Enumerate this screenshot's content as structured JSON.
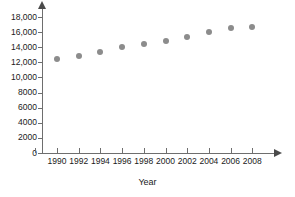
{
  "chart_data": {
    "type": "scatter",
    "title": "",
    "subtitle": "",
    "xlabel": "Year",
    "ylabel": "",
    "x": [
      1990,
      1992,
      1994,
      1996,
      1998,
      2000,
      2002,
      2004,
      2006,
      2008
    ],
    "values": [
      12500,
      12900,
      13350,
      14050,
      14400,
      14800,
      15400,
      16000,
      16500,
      16700
    ],
    "series": [
      {
        "name": "",
        "x": [
          1990,
          1992,
          1994,
          1996,
          1998,
          2000,
          2002,
          2004,
          2006,
          2008
        ],
        "values": [
          12500,
          12900,
          13350,
          14050,
          14400,
          14800,
          15400,
          16000,
          16500,
          16700
        ]
      }
    ],
    "xlim": [
      1989,
      2009
    ],
    "ylim": [
      0,
      18000
    ],
    "x_tick_labels": [
      "1990",
      "1992",
      "1994",
      "1996",
      "1998",
      "2000",
      "2002",
      "2004",
      "2006",
      "2008"
    ],
    "y_tick_labels": [
      "0",
      "2000",
      "4000",
      "6000",
      "8000",
      "10,000",
      "12,000",
      "14,000",
      "16,000",
      "18,000"
    ],
    "y_tick_values": [
      0,
      2000,
      4000,
      6000,
      8000,
      10000,
      12000,
      14000,
      16000,
      18000
    ],
    "grid": false,
    "legend": null,
    "legend_position": "none",
    "marker_color": "#8c8c8c",
    "axis_color": "#6e6e6e",
    "text_color": "#1a1a1a",
    "background_color": "#ffffff",
    "annotations": []
  }
}
